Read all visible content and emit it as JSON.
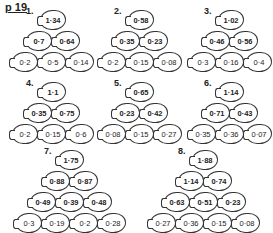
{
  "page": {
    "label": "p 19"
  },
  "pyramids": [
    {
      "number": "1.",
      "x": 12,
      "y": 10,
      "rows": [
        [
          "1·34"
        ],
        [
          "0·7",
          "0·64"
        ],
        [
          "0·2",
          "0·5",
          "0·14"
        ]
      ]
    },
    {
      "number": "2.",
      "x": 100,
      "y": 10,
      "rows": [
        [
          "0·58"
        ],
        [
          "0·35",
          "0·23"
        ],
        [
          "0·2",
          "0·15",
          "0·08"
        ]
      ]
    },
    {
      "number": "3.",
      "x": 190,
      "y": 10,
      "rows": [
        [
          "1·02"
        ],
        [
          "0·46",
          "0·56"
        ],
        [
          "0·3",
          "0·16",
          "0·4"
        ]
      ]
    },
    {
      "number": "4.",
      "x": 12,
      "y": 82,
      "rows": [
        [
          "1·1"
        ],
        [
          "0·35",
          "0·75"
        ],
        [
          "0·2",
          "0·15",
          "0·6"
        ]
      ]
    },
    {
      "number": "5.",
      "x": 100,
      "y": 82,
      "rows": [
        [
          "0·65"
        ],
        [
          "0·23",
          "0·42"
        ],
        [
          "0·08",
          "0·15",
          "0·27"
        ]
      ]
    },
    {
      "number": "6.",
      "x": 190,
      "y": 82,
      "rows": [
        [
          "1·14"
        ],
        [
          "0·71",
          "0·43"
        ],
        [
          "0·35",
          "0·36",
          "0·07"
        ]
      ]
    },
    {
      "number": "7.",
      "x": 16,
      "y": 150,
      "rows": [
        [
          "1·75"
        ],
        [
          "0·88",
          "0·87"
        ],
        [
          "0·49",
          "0·39",
          "0·48"
        ],
        [
          "0·3",
          "0·19",
          "0·2",
          "0·28"
        ]
      ]
    },
    {
      "number": "8.",
      "x": 150,
      "y": 150,
      "rows": [
        [
          "1·88"
        ],
        [
          "1·14",
          "0·74"
        ],
        [
          "0·63",
          "0·51",
          "0·23"
        ],
        [
          "0·27",
          "0·36",
          "0·15",
          "0·08"
        ]
      ]
    }
  ]
}
